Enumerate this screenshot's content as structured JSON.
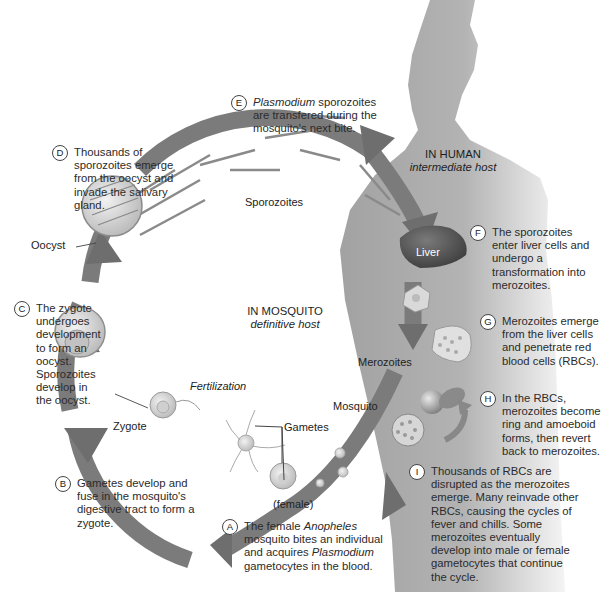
{
  "hosts": {
    "human": {
      "title": "IN HUMAN",
      "subtitle": "intermediate host"
    },
    "mosquito": {
      "title": "IN MOSQUITO",
      "subtitle": "definitive host"
    }
  },
  "labels": {
    "sporozoites": "Sporozoites",
    "oocyst": "Oocyst",
    "liver": "Liver",
    "merozoites": "Merozoites",
    "mosquito": "Mosquito",
    "fertilization": "Fertilization",
    "zygote": "Zygote",
    "gametes": "Gametes",
    "female": "(female)"
  },
  "steps": [
    {
      "letter": "A",
      "pre": "The female ",
      "em": "Anopheles",
      "post": " mosquito bites an individual and acquires ",
      "em2": "Plasmodium",
      "post2": " gametocytes in the blood."
    },
    {
      "letter": "B",
      "text": "Gametes develop and fuse in the mosquito's digestive tract to form a zygote."
    },
    {
      "letter": "C",
      "text": "The zygote undergoes development to form an oocyst. Sporozoites develop in the oocyst."
    },
    {
      "letter": "D",
      "text": "Thousands of sporozoites emerge from the oocyst and invade the salivary gland."
    },
    {
      "letter": "E",
      "em": "Plasmodium",
      "post": " sporozoites are transfered during the mosquito's next bite."
    },
    {
      "letter": "F",
      "text": "The sporozoites enter liver cells and undergo a transformation into merozoites."
    },
    {
      "letter": "G",
      "text": "Merozoites emerge from the liver cells and penetrate red blood cells (RBCs)."
    },
    {
      "letter": "H",
      "text": "In the RBCs, merozoites become ring and amoeboid forms, then revert back to merozoites."
    },
    {
      "letter": "I",
      "text": "Thousands of RBCs are disrupted as the merozoites emerge. Many reinvade other RBCs, causing the cycles of fever and chills. Some merozoites eventually develop into male or female gametocytes that continue the cycle."
    }
  ],
  "colors": {
    "arrow": "#7a7a7a",
    "human_silhouette": "#a9a9a9",
    "liver": "#5e5e5e",
    "cell_fill": "#d6d6d6",
    "text": "#2b2b2b"
  }
}
